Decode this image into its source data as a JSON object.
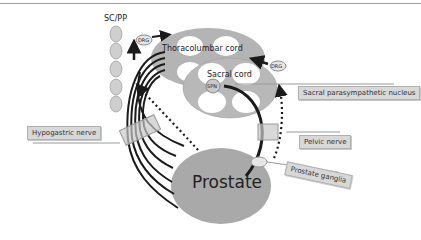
{
  "labels": {
    "sc_pp": "SC/PP",
    "drg_top": "DRG",
    "drg_right": "DRG",
    "thoracolumbar": "Thoracolumbar cord",
    "sacral": "Sacral cord",
    "spn": "SPN",
    "sacral_nucleus": "Sacral parasympathetic nucleus",
    "hypogastric": "Hypogastric nerve",
    "pelvic": "Pelvic nerve",
    "prostate": "Prostate",
    "prostate_ganglia": "Prostate ganglia"
  },
  "colors": {
    "organ_fill": "#a9a9a9",
    "cord_fill": "#b8b8b8",
    "ganglion_fill": "#d0d0d0",
    "label_bg": "#d8d8d8",
    "nerve": "#1a1a1a"
  }
}
